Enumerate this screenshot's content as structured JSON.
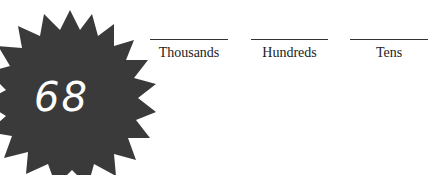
{
  "badge": {
    "number": "68",
    "fill": "#3a3a3a"
  },
  "place_values": [
    {
      "label": "Thousands",
      "value": ""
    },
    {
      "label": "Hundreds",
      "value": ""
    },
    {
      "label": "Tens",
      "value": ""
    }
  ]
}
